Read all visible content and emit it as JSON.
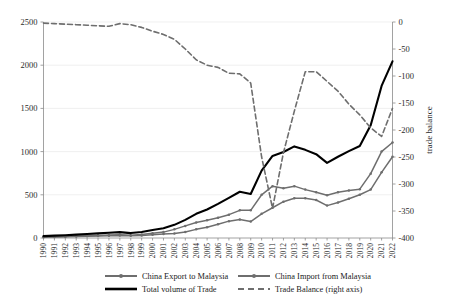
{
  "chart_data": {
    "type": "line",
    "title": "",
    "xlabel": "",
    "ylabel": "",
    "y2label": "trade balance",
    "grid": true,
    "legend_position": "bottom",
    "ylim": [
      0,
      2500
    ],
    "y2lim": [
      -400,
      0
    ],
    "yticks": [
      0,
      500,
      1000,
      1500,
      2000,
      2500
    ],
    "y2ticks": [
      -400,
      -350,
      -300,
      -250,
      -200,
      -150,
      -100,
      -50,
      0
    ],
    "categories": [
      "1990",
      "1991",
      "1992",
      "1993",
      "1994",
      "1995",
      "1996",
      "1997",
      "1998",
      "1999",
      "2000",
      "2001",
      "2002",
      "2003",
      "2004",
      "2005",
      "2006",
      "2007",
      "2008",
      "2009",
      "2010",
      "2011",
      "2012",
      "2013",
      "2014",
      "2015",
      "2016",
      "2017",
      "2018",
      "2019",
      "2020",
      "2021",
      "2022"
    ],
    "series": [
      {
        "name": "China Export to Malaysia",
        "axis": "left",
        "color": "#6e6e6e",
        "style": "solid-marker",
        "values": [
          10,
          12,
          14,
          17,
          20,
          23,
          26,
          30,
          25,
          30,
          38,
          45,
          52,
          70,
          100,
          125,
          160,
          195,
          215,
          190,
          280,
          350,
          420,
          460,
          460,
          440,
          375,
          410,
          455,
          500,
          560,
          760,
          940
        ]
      },
      {
        "name": "China Import from Malaysia",
        "axis": "left",
        "color": "#6e6e6e",
        "style": "solid-marker",
        "values": [
          12,
          15,
          18,
          22,
          26,
          30,
          34,
          38,
          32,
          40,
          55,
          68,
          100,
          140,
          180,
          205,
          235,
          270,
          320,
          320,
          500,
          600,
          575,
          600,
          560,
          530,
          495,
          530,
          550,
          565,
          745,
          1000,
          1105
        ]
      },
      {
        "name": "Total volume of  Trade",
        "axis": "left",
        "color": "#000000",
        "style": "solid-thick",
        "values": [
          22,
          27,
          32,
          39,
          46,
          53,
          60,
          68,
          57,
          70,
          93,
          113,
          152,
          210,
          280,
          330,
          395,
          465,
          535,
          510,
          780,
          950,
          995,
          1060,
          1020,
          970,
          870,
          940,
          1005,
          1065,
          1305,
          1760,
          2045
        ]
      },
      {
        "name": "Trade Balance (right axis)",
        "axis": "right",
        "color": "#6e6e6e",
        "style": "dashed",
        "values": [
          -2,
          -3,
          -4,
          -5,
          -6,
          -7,
          -8,
          -3,
          -5,
          -10,
          -17,
          -23,
          -32,
          -50,
          -70,
          -80,
          -84,
          -95,
          -96,
          -113,
          -250,
          -345,
          -242,
          -165,
          -92,
          -92,
          -110,
          -128,
          -152,
          -172,
          -196,
          -212,
          -160
        ]
      }
    ],
    "annotations": []
  },
  "legend": {
    "items": [
      {
        "label": "China Export to Malaysia",
        "marker": "line-with-dots",
        "color": "#6e6e6e"
      },
      {
        "label": "China Import from Malaysia",
        "marker": "line-with-dots",
        "color": "#6e6e6e"
      },
      {
        "label": "Total volume of  Trade",
        "marker": "thick-line",
        "color": "#000000"
      },
      {
        "label": "Trade Balance (right axis)",
        "marker": "dashed-line",
        "color": "#6e6e6e"
      }
    ]
  },
  "axes": {
    "left": {
      "ticks": [
        "0",
        "500",
        "1000",
        "1500",
        "2000",
        "2500"
      ]
    },
    "right": {
      "title": "trade balance",
      "ticks": [
        "-400",
        "-350",
        "-300",
        "-250",
        "-200",
        "-150",
        "-100",
        "-50",
        "0"
      ]
    },
    "bottom": {
      "ticks": [
        "1990",
        "1991",
        "1992",
        "1993",
        "1994",
        "1995",
        "1996",
        "1997",
        "1998",
        "1999",
        "2000",
        "2001",
        "2002",
        "2003",
        "2004",
        "2005",
        "2006",
        "2007",
        "2008",
        "2009",
        "2010",
        "2011",
        "2012",
        "2013",
        "2014",
        "2015",
        "2016",
        "2017",
        "2018",
        "2019",
        "2020",
        "2021",
        "2022"
      ]
    }
  }
}
